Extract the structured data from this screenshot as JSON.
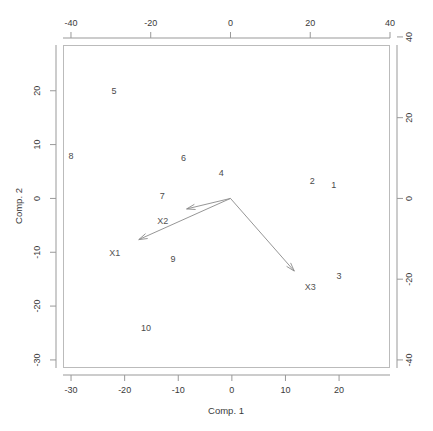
{
  "chart_data": {
    "type": "scatter",
    "title": "",
    "subtitle": "",
    "xlabel": "Comp. 1",
    "ylabel": "Comp. 2",
    "grid": false,
    "legend": "none",
    "bottom_axis": {
      "label": "Comp. 1",
      "ticks": [
        -30,
        -20,
        -10,
        0,
        10,
        20
      ],
      "tick_labels": [
        "-30",
        "-20",
        "-10",
        "0",
        "10",
        "20"
      ],
      "range": [
        -31.5,
        29.5
      ]
    },
    "left_axis": {
      "label": "Comp. 2",
      "ticks": [
        20,
        10,
        0,
        -10,
        -20,
        -30
      ],
      "tick_labels": [
        "20",
        "10",
        "0",
        "-10",
        "-20",
        "-30"
      ],
      "range": [
        -31.5,
        28.5
      ]
    },
    "top_axis": {
      "label": "",
      "ticks": [
        -40,
        -20,
        0,
        20,
        40
      ],
      "tick_labels": [
        "-40",
        "-20",
        "0",
        "20",
        "40"
      ],
      "range": [
        -42,
        40
      ]
    },
    "right_axis": {
      "label": "",
      "ticks": [
        40,
        20,
        0,
        -20,
        -40
      ],
      "tick_labels": [
        "40",
        "20",
        "0",
        "-20",
        "-40"
      ],
      "range": [
        -42,
        38
      ]
    },
    "observations": [
      {
        "label": "1",
        "x": 19.0,
        "y": 2.6
      },
      {
        "label": "2",
        "x": 15.0,
        "y": 3.3
      },
      {
        "label": "3",
        "x": 20.0,
        "y": -14.3
      },
      {
        "label": "4",
        "x": -2.0,
        "y": 4.8
      },
      {
        "label": "5",
        "x": -22.0,
        "y": 20.0
      },
      {
        "label": "6",
        "x": -9.0,
        "y": 7.5
      },
      {
        "label": "7",
        "x": -13.0,
        "y": 0.5
      },
      {
        "label": "8",
        "x": -30.0,
        "y": 8.0
      },
      {
        "label": "9",
        "x": -11.0,
        "y": -11.3
      },
      {
        "label": "10",
        "x": -16.0,
        "y": -24.0
      }
    ],
    "variable_arrows": [
      {
        "label": "X1",
        "tip_x": -23.0,
        "tip_y": -10.2,
        "label_x": -29.0,
        "label_y": -13.5
      },
      {
        "label": "X2",
        "tip_x": -11.0,
        "tip_y": -2.6,
        "label_x": -17.0,
        "label_y": -5.5
      },
      {
        "label": "X3",
        "tip_x": 16.0,
        "tip_y": -18.0,
        "label_x": 20.0,
        "label_y": -22.0
      }
    ],
    "arrow_origin": {
      "x": 0,
      "y": 0
    },
    "colors": {
      "observation_text": "#4a4a4a",
      "arrow": "#8a8a8a",
      "variable_text": "#555555",
      "axis": "#999999",
      "frame": "#bbbbbb",
      "background": "#ffffff"
    }
  }
}
